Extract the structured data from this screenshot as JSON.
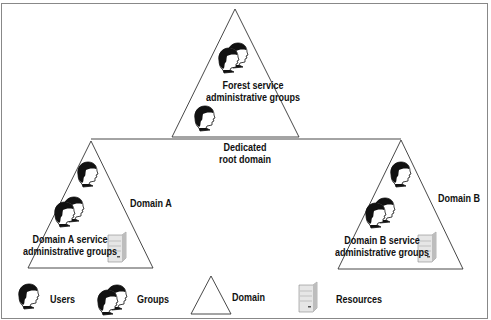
{
  "diagram": {
    "forest": {
      "label_line1": "Forest service",
      "label_line2": "administrative groups"
    },
    "root_domain": {
      "label_line1": "Dedicated",
      "label_line2": "root domain"
    },
    "domain_a": {
      "name": "Domain A",
      "label_line1": "Domain A service",
      "label_line2": "administrative groups"
    },
    "domain_b": {
      "name": "Domain B",
      "label_line1": "Domain B service",
      "label_line2": "administrative groups"
    }
  },
  "legend": {
    "users": "Users",
    "groups": "Groups",
    "domain": "Domain",
    "resources": "Resources"
  },
  "colors": {
    "line": "#333333",
    "frame": "#888888",
    "hair": "#111111",
    "skin": "#ffffff",
    "server": "#d9d9d9"
  }
}
